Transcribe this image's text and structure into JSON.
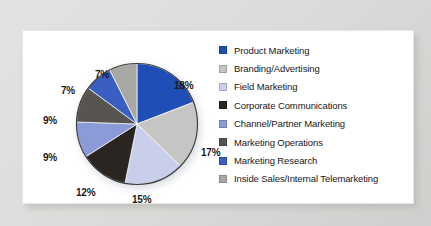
{
  "figure": {
    "card_background": "#ffffff",
    "mat_background": "#dcdcda"
  },
  "chart_data": {
    "type": "pie",
    "title": "",
    "subtitle": "",
    "xlabel": "",
    "ylabel": "",
    "legend_position": "right",
    "grid": false,
    "value_unit": "percent",
    "start_angle_deg": 0,
    "direction": "clockwise",
    "categories": [
      "Product Marketing",
      "Branding/Advertising",
      "Field Marketing",
      "Corporate Communications",
      "Channel/Partner Marketing",
      "Marketing Operations",
      "Marketing Research",
      "Inside Sales/Internal Telemarketing"
    ],
    "values": [
      18,
      17,
      15,
      12,
      9,
      9,
      7,
      7
    ],
    "data_labels": [
      "18%",
      "17%",
      "15%",
      "12%",
      "9%",
      "9%",
      "7%",
      "7%"
    ],
    "colors": [
      "#1f4fb6",
      "#c5c6c3",
      "#c9cfea",
      "#2a2520",
      "#8a9bd8",
      "#585450",
      "#3a5fc0",
      "#a8a9a5"
    ],
    "slices": [
      {
        "label": "Product Marketing",
        "value": 18,
        "data_label": "18%",
        "color": "#1f4fb6",
        "label_x": 143,
        "label_y": 45
      },
      {
        "label": "Branding/Advertising",
        "value": 17,
        "data_label": "17%",
        "color": "#c5c6c3",
        "label_x": 170,
        "label_y": 112
      },
      {
        "label": "Field Marketing",
        "value": 15,
        "data_label": "15%",
        "color": "#c9cfea",
        "label_x": 101,
        "label_y": 159
      },
      {
        "label": "Corporate Communications",
        "value": 12,
        "data_label": "12%",
        "color": "#2a2520",
        "label_x": 45,
        "label_y": 152
      },
      {
        "label": "Channel/Partner Marketing",
        "value": 9,
        "data_label": "9%",
        "color": "#8a9bd8",
        "label_x": 12,
        "label_y": 117
      },
      {
        "label": "Marketing Operations",
        "value": 9,
        "data_label": "9%",
        "color": "#585450",
        "label_x": 12,
        "label_y": 80
      },
      {
        "label": "Marketing Research",
        "value": 7,
        "data_label": "7%",
        "color": "#3a5fc0",
        "label_x": 30,
        "label_y": 50
      },
      {
        "label": "Inside Sales/Internal Telemarketing",
        "value": 7,
        "data_label": "7%",
        "color": "#a8a9a5",
        "label_x": 64,
        "label_y": 34
      }
    ]
  },
  "legend": {
    "items": [
      {
        "label": "Product Marketing",
        "color": "#1f4fb6"
      },
      {
        "label": "Branding/Advertising",
        "color": "#c5c6c3"
      },
      {
        "label": "Field Marketing",
        "color": "#c9cfea"
      },
      {
        "label": "Corporate Communications",
        "color": "#2a2520"
      },
      {
        "label": "Channel/Partner Marketing",
        "color": "#8a9bd8"
      },
      {
        "label": "Marketing Operations",
        "color": "#585450"
      },
      {
        "label": "Marketing Research",
        "color": "#3a5fc0"
      },
      {
        "label": "Inside Sales/Internal Telemarketing",
        "color": "#a8a9a5"
      }
    ]
  }
}
